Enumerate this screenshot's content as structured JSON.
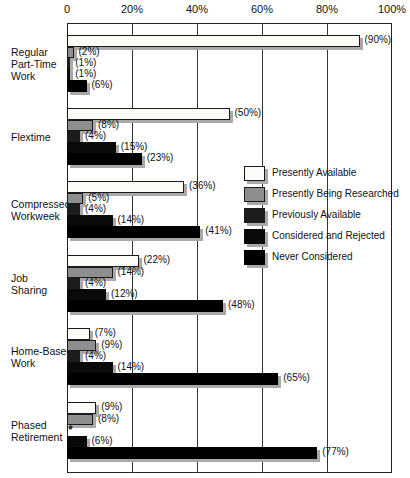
{
  "chart_data": {
    "type": "bar",
    "orientation": "horizontal",
    "title": "",
    "xlabel": "",
    "ylabel": "",
    "xlim": [
      0,
      100
    ],
    "x_ticks": [
      "0",
      "20%",
      "40%",
      "60%",
      "80%",
      "100%"
    ],
    "grid": true,
    "legend_position": "right-center inside plot",
    "categories": [
      "Regular Part-Time Work",
      "Flextime",
      "Compressed Workweek",
      "Job Sharing",
      "Home-Based Work",
      "Phased Retirement"
    ],
    "series": [
      {
        "name": "Presently Available",
        "color": "#fbfbf8",
        "values": [
          90,
          50,
          36,
          22,
          7,
          9
        ]
      },
      {
        "name": "Presently Being Researched",
        "color": "#8e8e8e",
        "values": [
          2,
          8,
          5,
          14,
          9,
          8
        ]
      },
      {
        "name": "Previously Available",
        "color": "#1c1c1c",
        "values": [
          1,
          4,
          4,
          4,
          4,
          null
        ]
      },
      {
        "name": "Considered and Rejected",
        "color": "#0a0a0a",
        "values": [
          1,
          15,
          14,
          12,
          14,
          6
        ]
      },
      {
        "name": "Never Considered",
        "color": "#000000",
        "values": [
          6,
          23,
          41,
          48,
          65,
          77
        ]
      }
    ],
    "annotations": [
      "* shown for Phased Retirement / Previously Available (no value)"
    ]
  },
  "axis": {
    "ticks": [
      "0",
      "20%",
      "40%",
      "60%",
      "80%",
      "100%"
    ]
  },
  "categories": [
    {
      "label": "Regular\nPart-Time\nWork"
    },
    {
      "label": "Flextime"
    },
    {
      "label": "Compressed\nWorkweek"
    },
    {
      "label": "Job\nSharing"
    },
    {
      "label": "Home-Based\nWork"
    },
    {
      "label": "Phased\nRetirement"
    }
  ],
  "legend": [
    {
      "label": "Presently Available"
    },
    {
      "label": "Presently Being Researched"
    },
    {
      "label": "Previously Available"
    },
    {
      "label": "Considered and Rejected"
    },
    {
      "label": "Never Considered"
    }
  ],
  "value_labels": [
    [
      "(90%)",
      "(2%)",
      "(1%)",
      "(1%)",
      "(6%)"
    ],
    [
      "(50%)",
      "(8%)",
      "(4%)",
      "(15%)",
      "(23%)"
    ],
    [
      "(36%)",
      "(5%)",
      "(4%)",
      "(14%)",
      "(41%)"
    ],
    [
      "(22%)",
      "(14%)",
      "(4%)",
      "(12%)",
      "(48%)"
    ],
    [
      "(7%)",
      "(9%)",
      "(4%)",
      "(14%)",
      "(65%)"
    ],
    [
      "(9%)",
      "(8%)",
      "*",
      "(6%)",
      "(77%)"
    ]
  ]
}
